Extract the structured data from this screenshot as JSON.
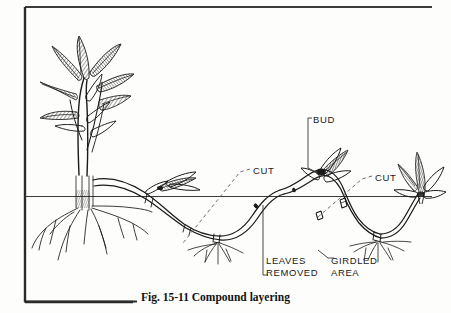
{
  "figure": {
    "caption": "Fig. 15-11  Compound layering",
    "caption_number": "15-11",
    "caption_title": "Compound layering",
    "ink_color": "#1a1a1a",
    "background_color": "#fdfdfb",
    "leader_color": "#555555"
  },
  "labels": {
    "bud": "BUD",
    "cut_left": "CUT",
    "cut_right": "CUT",
    "leaves_removed_line1": "LEAVES",
    "leaves_removed_line2": "REMOVED",
    "girdled_area_line1": "GIRDLED",
    "girdled_area_line2": "AREA"
  },
  "diagram": {
    "type": "botanical-illustration",
    "ground_line_y": 196,
    "elements": [
      {
        "name": "mother-plant",
        "description": "leafy shrub with shaded lanceolate leaves at left"
      },
      {
        "name": "root-system",
        "description": "fibrous roots of mother plant below soil line"
      },
      {
        "name": "layered-stem",
        "description": "long undulating stem weaving above and below soil"
      },
      {
        "name": "leaf-cluster-mid",
        "description": "small leaf shoot emerging above soil"
      },
      {
        "name": "rooted-node-1",
        "description": "buried node with new roots"
      },
      {
        "name": "rooted-node-2",
        "description": "second buried node with new roots"
      },
      {
        "name": "bud-shoot",
        "description": "bud producing new shoot above soil"
      },
      {
        "name": "daughter-plant",
        "description": "new leafy shoot at right end"
      },
      {
        "name": "girdled-band",
        "description": "girdled/ringed section of stem below soil"
      }
    ]
  }
}
